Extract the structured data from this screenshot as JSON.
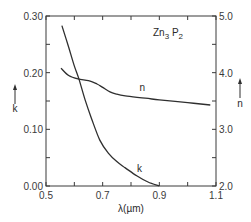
{
  "chart_data": {
    "type": "line",
    "title_parts": {
      "base1": "Zn",
      "sub1": "3",
      "base2": " P",
      "sub2": "2"
    },
    "xlabel": "λ(µm)",
    "ylabel_left": "k",
    "ylabel_right": "n",
    "xlim": [
      0.5,
      1.1
    ],
    "ylim_left": [
      0.0,
      0.3
    ],
    "ylim_right": [
      2.0,
      5.0
    ],
    "x_ticks": [
      0.5,
      0.6,
      0.7,
      0.8,
      0.9,
      1.0,
      1.1
    ],
    "x_tick_labels": [
      "0.5",
      "0.7",
      "0.9",
      "1.1"
    ],
    "x_tick_label_values": [
      0.5,
      0.7,
      0.9,
      1.1
    ],
    "y_left_ticks": [
      0.0,
      0.05,
      0.1,
      0.15,
      0.2,
      0.25,
      0.3
    ],
    "y_left_tick_labels": [
      "0.00",
      "0.10",
      "0.20",
      "0.30"
    ],
    "y_left_tick_label_values": [
      0.0,
      0.1,
      0.2,
      0.3
    ],
    "y_right_ticks": [
      2.0,
      2.5,
      3.0,
      3.5,
      4.0,
      4.5,
      5.0
    ],
    "y_right_tick_labels": [
      "2.0",
      "3.0",
      "4.0",
      "5.0"
    ],
    "y_right_tick_label_values": [
      2.0,
      3.0,
      4.0,
      5.0
    ],
    "grid": false,
    "legend": "inline labels",
    "series": [
      {
        "name": "k",
        "axis": "left",
        "label_position": {
          "x": 0.83,
          "y": 0.025
        },
        "x": [
          0.556,
          0.58,
          0.6,
          0.616,
          0.638,
          0.66,
          0.69,
          0.72,
          0.75,
          0.78,
          0.82,
          0.86,
          0.9
        ],
        "values": [
          0.283,
          0.245,
          0.212,
          0.189,
          0.152,
          0.12,
          0.081,
          0.058,
          0.043,
          0.032,
          0.018,
          0.007,
          0.0
        ]
      },
      {
        "name": "n",
        "axis": "right",
        "label_position": {
          "x": 0.84,
          "y": 3.68
        },
        "x": [
          0.553,
          0.58,
          0.613,
          0.65,
          0.68,
          0.7,
          0.726,
          0.75,
          0.78,
          0.85,
          0.9,
          1.0,
          1.08
        ],
        "values": [
          4.08,
          3.95,
          3.89,
          3.86,
          3.8,
          3.74,
          3.66,
          3.62,
          3.59,
          3.55,
          3.52,
          3.47,
          3.43
        ]
      }
    ]
  },
  "colors": {
    "line": "#2f2f2f",
    "axis": "#3a3a3a",
    "background": "#ffffff"
  }
}
